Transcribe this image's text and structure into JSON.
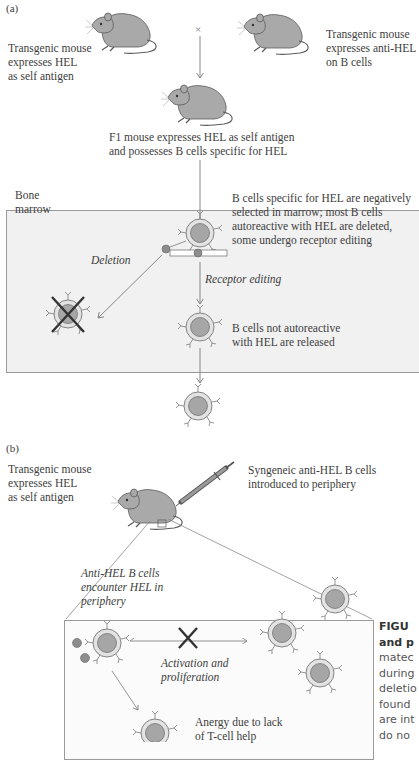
{
  "figure": {
    "panel_a": {
      "label": "(a)",
      "mouse_left_label": "Transgenic mouse\nexpresses HEL\nas self antigen",
      "mouse_right_label": "Transgenic mouse\nexpresses anti-HEL\non B cells",
      "cross_symbol": "×",
      "f1_label": "F1 mouse expresses HEL as self antigen\nand possesses B cells specific for HEL",
      "bone_marrow_label": "Bone\nmarrow",
      "selection_label": "B cells specific for HEL are negatively\nselected in marrow; most B cells\nautoreactive with HEL are deleted,\nsome undergo receptor editing",
      "deletion_label": "Deletion",
      "receptor_editing_label": "Receptor editing",
      "released_label": "B cells not autoreactive\nwith HEL are released"
    },
    "panel_b": {
      "label": "(b)",
      "mouse_label": "Transgenic mouse\nexpresses HEL\nas self antigen",
      "injection_label": "Syngeneic anti-HEL B cells\nintroduced to periphery",
      "encounter_label": "Anti-HEL B cells\nencounter HEL in\nperiphery",
      "activation_label": "Activation and\nproliferation",
      "anergy_label": "Anergy due to lack\nof T-cell help"
    },
    "caption": {
      "line1": "FIGU",
      "line2": "and p",
      "line3": "matec",
      "line4": "during",
      "line5": "deletio",
      "line6": "found",
      "line7": "are int",
      "line8": "do no"
    },
    "colors": {
      "mouse_fill": "#a9a9a9",
      "cell_outer": "#e3e3e3",
      "cell_nucleus": "#a6a6a6",
      "box_a_bg": "#f1f1f1",
      "box_b_bg": "#fbfbfb",
      "line": "#7a7a7a"
    }
  }
}
